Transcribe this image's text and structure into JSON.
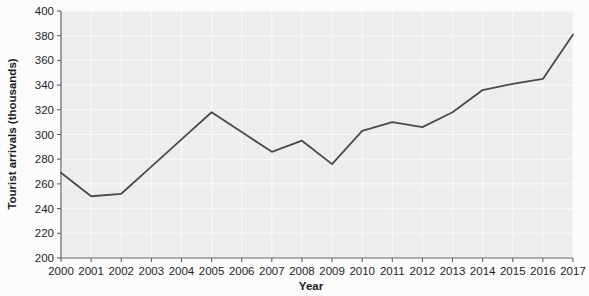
{
  "chart_data": {
    "type": "line",
    "title": "",
    "xlabel": "Year",
    "ylabel": "Tourist arrivals (thousands)",
    "categories": [
      "2000",
      "2001",
      "2002",
      "2003",
      "2004",
      "2005",
      "2006",
      "2007",
      "2008",
      "2009",
      "2010",
      "2011",
      "2012",
      "2013",
      "2014",
      "2015",
      "2016",
      "2017"
    ],
    "values": [
      269,
      250,
      252,
      274,
      296,
      318,
      302,
      286,
      295,
      276,
      303,
      310,
      306,
      318,
      336,
      341,
      345,
      381
    ],
    "series": [
      {
        "name": "Tourist arrivals",
        "values": [
          269,
          250,
          252,
          274,
          296,
          318,
          302,
          286,
          295,
          276,
          303,
          310,
          306,
          318,
          336,
          341,
          345,
          381
        ]
      }
    ],
    "ylim": [
      200,
      400
    ],
    "yticks": [
      200,
      220,
      240,
      260,
      280,
      300,
      320,
      340,
      360,
      380,
      400
    ],
    "ytick_labels": [
      "200",
      "220",
      "240",
      "260",
      "280",
      "300",
      "320",
      "340",
      "360",
      "380",
      "400"
    ],
    "xtick_labels": [
      "2000",
      "2001",
      "2002",
      "2003",
      "2004",
      "2005",
      "2006",
      "2007",
      "2008",
      "2009",
      "2010",
      "2011",
      "2012",
      "2013",
      "2014",
      "2015",
      "2016",
      "2017"
    ],
    "grid": true,
    "grid_color": "#f7f7f7",
    "plot_background": "#ededed",
    "line_color": "#4a4a4a",
    "line_width": 1.8,
    "markers": "none",
    "legend": "none",
    "legend_position": "none"
  },
  "axes": {
    "y_title": "Tourist arrivals (thousands)",
    "x_title": "Year"
  }
}
